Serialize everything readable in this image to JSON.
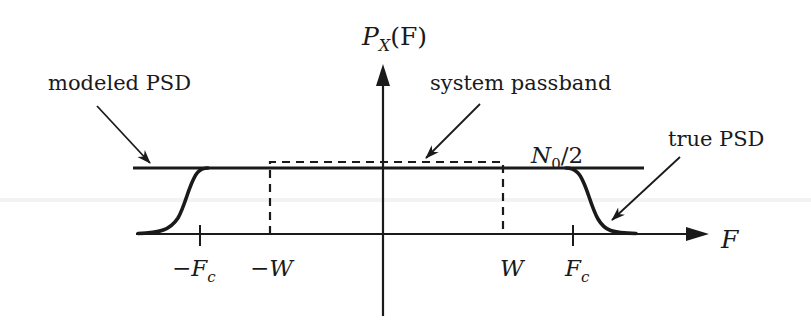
{
  "diagram": {
    "type": "power-spectral-density-sketch",
    "y_axis": {
      "label_base": "P",
      "label_sub": "X",
      "label_arg": "(F)"
    },
    "x_axis": {
      "label": "F"
    },
    "level_label": {
      "base": "N",
      "sub": "0",
      "rest": "/2"
    },
    "ticks": [
      {
        "label": "−F",
        "sub": "c",
        "x": 200
      },
      {
        "label": "−W",
        "sub": "",
        "x": 270
      },
      {
        "label": "W",
        "sub": "",
        "x": 503
      },
      {
        "label": "F",
        "sub": "c",
        "x": 573
      }
    ],
    "annotations": {
      "modeled_psd": "modeled PSD",
      "system_passband": "system passband",
      "true_psd": "true PSD"
    },
    "colors": {
      "ink": "#1a1a1a",
      "background": "#ffffff"
    }
  }
}
